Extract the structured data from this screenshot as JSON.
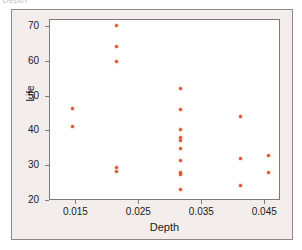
{
  "figure": {
    "top_text_remnant": "Depth",
    "panel_background": "#f3eeec",
    "plot_background": "#ffffff",
    "frame_color": "#7e7a77"
  },
  "chart_data": {
    "type": "scatter",
    "title": "",
    "xlabel": "Depth",
    "ylabel": "Life",
    "xlim": [
      0.0108,
      0.0475
    ],
    "ylim": [
      20,
      72
    ],
    "xticks": [
      0.015,
      0.025,
      0.035,
      0.045
    ],
    "xtick_labels": [
      "0.015",
      "0.025",
      "0.035",
      "0.045"
    ],
    "yticks": [
      20,
      30,
      40,
      50,
      60,
      70
    ],
    "ytick_labels": [
      "20",
      "30",
      "40",
      "50",
      "60",
      "70"
    ],
    "grid": false,
    "legend": null,
    "marker_color": "#d2502a",
    "points": [
      {
        "x": 0.0143,
        "y": 46.5
      },
      {
        "x": 0.0143,
        "y": 41.5
      },
      {
        "x": 0.0213,
        "y": 70.3
      },
      {
        "x": 0.0213,
        "y": 64.3
      },
      {
        "x": 0.0213,
        "y": 60.2
      },
      {
        "x": 0.0213,
        "y": 29.5
      },
      {
        "x": 0.0213,
        "y": 28.6
      },
      {
        "x": 0.0315,
        "y": 52.3
      },
      {
        "x": 0.0315,
        "y": 46.4
      },
      {
        "x": 0.0315,
        "y": 40.4
      },
      {
        "x": 0.0315,
        "y": 38.2
      },
      {
        "x": 0.0315,
        "y": 37.3
      },
      {
        "x": 0.0315,
        "y": 35.0
      },
      {
        "x": 0.0315,
        "y": 31.5
      },
      {
        "x": 0.0315,
        "y": 28.3
      },
      {
        "x": 0.0315,
        "y": 27.5
      },
      {
        "x": 0.0315,
        "y": 23.4
      },
      {
        "x": 0.041,
        "y": 44.3
      },
      {
        "x": 0.041,
        "y": 32.3
      },
      {
        "x": 0.041,
        "y": 24.5
      },
      {
        "x": 0.0455,
        "y": 33.2
      },
      {
        "x": 0.0455,
        "y": 28.3
      }
    ]
  }
}
